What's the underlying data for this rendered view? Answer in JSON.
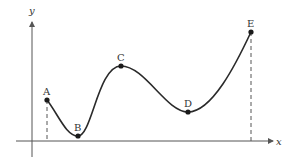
{
  "diagram": {
    "type": "function-curve",
    "axes": {
      "x_label": "x",
      "y_label": "y",
      "color": "#555555"
    },
    "curve": {
      "color": "#2a2a2a"
    },
    "points": [
      {
        "label": "A",
        "x": 47,
        "y": 100,
        "kind": "endpoint"
      },
      {
        "label": "B",
        "x": 78,
        "y": 136,
        "kind": "local-min"
      },
      {
        "label": "C",
        "x": 121,
        "y": 66,
        "kind": "local-max"
      },
      {
        "label": "D",
        "x": 188,
        "y": 112,
        "kind": "local-min"
      },
      {
        "label": "E",
        "x": 251,
        "y": 32,
        "kind": "endpoint"
      }
    ],
    "dashed_drops": [
      "A",
      "E"
    ]
  }
}
